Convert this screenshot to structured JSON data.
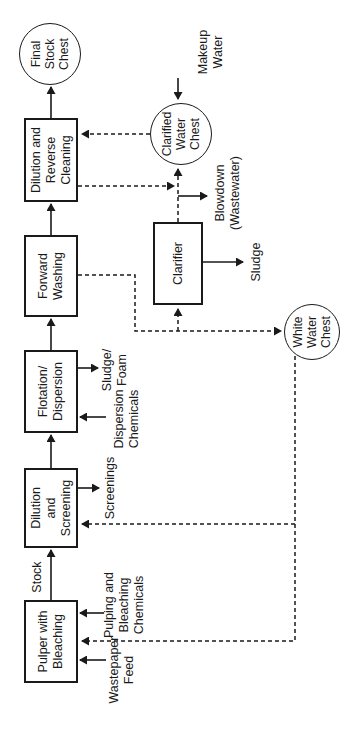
{
  "nodes": {
    "pulper": {
      "label": "Pulper with\nBleaching"
    },
    "dilution_screening": {
      "label": "Dilution\nand\nScreening"
    },
    "flotation_dispersion": {
      "label": "Flotation/\nDispersion"
    },
    "forward_washing": {
      "label": "Forward\nWashing"
    },
    "dilution_reverse_cleaning": {
      "label": "Dilution and\nReverse\nCleaning"
    },
    "final_stock_chest": {
      "label": "Final\nStock\nChest"
    },
    "clarifier": {
      "label": "Clarifier"
    },
    "clarified_water_chest": {
      "label": "Clarified\nWater\nChest"
    },
    "white_water_chest": {
      "label": "White\nWater\nChest"
    }
  },
  "stream_labels": {
    "stock": "Stock",
    "screenings": "Screenings",
    "sludge_foam": "Sludge/\nFoam",
    "dispersion_chemicals": "Dispersion\nChemicals",
    "pulping_chemicals": "Pulping and\nBleaching\nChemicals",
    "wastepaper_feed": "Wastepaper\nFeed",
    "sludge": "Sludge",
    "blowdown": "Blowdown\n(Wastewater)",
    "makeup_water": "Makeup\nWater"
  },
  "edges": [
    {
      "from": "Wastepaper Feed",
      "to": "Pulper with Bleaching",
      "style": "solid"
    },
    {
      "from": "Pulping and Bleaching Chemicals",
      "to": "Pulper with Bleaching",
      "style": "solid"
    },
    {
      "from": "Pulper with Bleaching",
      "to": "Dilution and Screening",
      "style": "solid",
      "label": "Stock"
    },
    {
      "from": "Dilution and Screening",
      "to": "Screenings",
      "style": "solid"
    },
    {
      "from": "Dilution and Screening",
      "to": "Flotation/Dispersion",
      "style": "solid"
    },
    {
      "from": "Dispersion Chemicals",
      "to": "Flotation/Dispersion",
      "style": "solid"
    },
    {
      "from": "Flotation/Dispersion",
      "to": "Sludge/Foam",
      "style": "solid"
    },
    {
      "from": "Flotation/Dispersion",
      "to": "Forward Washing",
      "style": "solid"
    },
    {
      "from": "Forward Washing",
      "to": "Dilution and Reverse Cleaning",
      "style": "solid"
    },
    {
      "from": "Forward Washing",
      "to": "White Water Chest",
      "style": "dashed"
    },
    {
      "from": "Forward Washing",
      "to": "Clarifier",
      "style": "dashed"
    },
    {
      "from": "Dilution and Reverse Cleaning",
      "to": "Final Stock Chest",
      "style": "solid"
    },
    {
      "from": "Dilution and Reverse Cleaning",
      "to": "Clarifier junction",
      "style": "dashed"
    },
    {
      "from": "Clarifier",
      "to": "Clarified Water Chest",
      "style": "dashed"
    },
    {
      "from": "Clarifier",
      "to": "Sludge",
      "style": "solid"
    },
    {
      "from": "Clarified Water Chest",
      "to": "Dilution and Reverse Cleaning",
      "style": "dashed"
    },
    {
      "from": "Clarified Water Chest",
      "to": "Blowdown (Wastewater)",
      "style": "solid"
    },
    {
      "from": "Makeup Water",
      "to": "Clarified Water Chest",
      "style": "solid"
    },
    {
      "from": "White Water Chest",
      "to": "Dilution and Screening",
      "style": "dashed"
    },
    {
      "from": "White Water Chest",
      "to": "Pulper with Bleaching",
      "style": "dashed"
    }
  ],
  "colors": {
    "line": "#1a1a1a",
    "text": "#1a1a1a",
    "background": "#ffffff"
  }
}
